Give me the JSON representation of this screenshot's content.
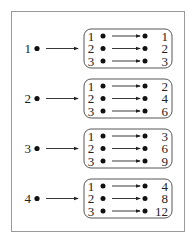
{
  "diagram": {
    "groups": [
      {
        "input": "1",
        "pairs": [
          [
            "1",
            "1"
          ],
          [
            "2",
            "2"
          ],
          [
            "3",
            "3"
          ]
        ]
      },
      {
        "input": "2",
        "pairs": [
          [
            "1",
            "2"
          ],
          [
            "2",
            "4"
          ],
          [
            "3",
            "6"
          ]
        ]
      },
      {
        "input": "3",
        "pairs": [
          [
            "1",
            "3"
          ],
          [
            "2",
            "6"
          ],
          [
            "3",
            "9"
          ]
        ]
      },
      {
        "input": "4",
        "pairs": [
          [
            "1",
            "4"
          ],
          [
            "2",
            "8"
          ],
          [
            "3",
            "12"
          ]
        ]
      }
    ]
  }
}
